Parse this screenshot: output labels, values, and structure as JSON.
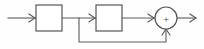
{
  "diagram": {
    "kind": "control-system-block-diagram",
    "title": "",
    "background_color": "#fefefe",
    "line_color": "#5a5a5a",
    "block_fill": "#ffffff",
    "block_stroke": "#565656",
    "input_signal_label": "",
    "output_signal_label": "",
    "blocks": [
      {
        "id": "block-1",
        "label": "",
        "x": 36,
        "y": 5,
        "width": 26,
        "height": 26
      },
      {
        "id": "block-2",
        "label": "",
        "x": 96,
        "y": 5,
        "width": 26,
        "height": 26
      }
    ],
    "summing_junction": {
      "id": "summing-junction",
      "sign": "+",
      "center_x": 166,
      "center_y": 18,
      "radius": 11,
      "input_signs": [
        "+",
        "+"
      ]
    },
    "wires": [
      {
        "id": "input-wire",
        "from": "input",
        "to": "block-1",
        "label": ""
      },
      {
        "id": "block1-to-block2-wire",
        "from": "block-1",
        "to": "block-2",
        "label": ""
      },
      {
        "id": "block2-to-sum-wire",
        "from": "block-2",
        "to": "summing-junction",
        "label": ""
      },
      {
        "id": "feedback-wire",
        "from": "block-1-output",
        "to": "summing-junction",
        "label": ""
      },
      {
        "id": "output-wire",
        "from": "summing-junction",
        "to": "output",
        "label": ""
      }
    ],
    "feedback_path": {
      "branch_x": 79,
      "bottom_y": 42,
      "return_x": 166
    }
  }
}
